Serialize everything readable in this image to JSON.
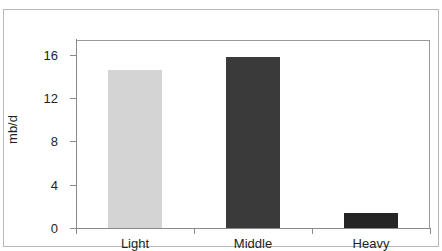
{
  "figure": {
    "clipped_top_caption": "",
    "frame_color": "#b9b9b9",
    "axis_color": "#8a8a8a"
  },
  "chart_data": {
    "type": "bar",
    "title": "",
    "xlabel": "",
    "ylabel": "mb/d",
    "categories": [
      "Light",
      "Middle",
      "Heavy"
    ],
    "values": [
      15.0,
      16.3,
      1.4
    ],
    "series": [
      {
        "name": "Crude quality",
        "values": [
          15.0,
          16.3,
          1.4
        ]
      }
    ],
    "ylim": [
      0,
      18
    ],
    "yticks": [
      0,
      4,
      8,
      12,
      16
    ],
    "ytick_labels": [
      "0",
      "4",
      "8",
      "12",
      "16"
    ],
    "grid": false,
    "legend": "none",
    "bar_colors": [
      "#d4d4d4",
      "#3a3a3a",
      "#252525"
    ]
  }
}
